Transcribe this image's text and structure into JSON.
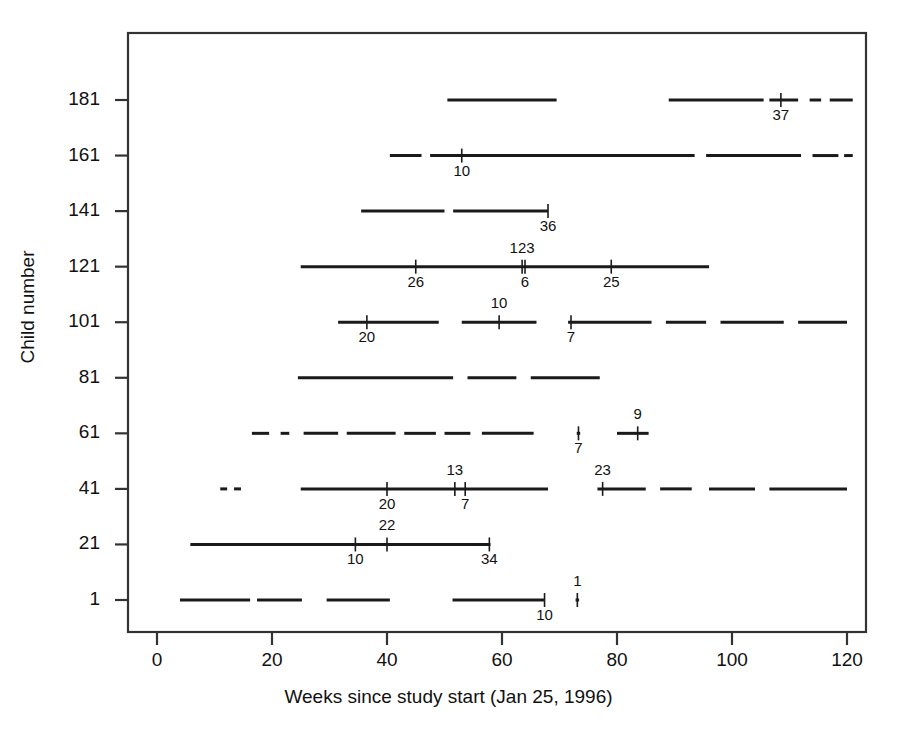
{
  "chart_data": {
    "type": "line",
    "title": "",
    "xlabel": "Weeks since study start (Jan 25, 1996)",
    "ylabel": "Child number",
    "xlim": [
      -3,
      123
    ],
    "ylim": [
      -9,
      201
    ],
    "xticks": [
      0,
      20,
      40,
      60,
      80,
      100,
      120
    ],
    "yticks": [
      1,
      21,
      41,
      61,
      81,
      101,
      121,
      141,
      161,
      181
    ],
    "grid": false,
    "legend": null,
    "series": [
      {
        "name": "1",
        "y": 1,
        "segments": [
          [
            4.0,
            16.2
          ],
          [
            17.4,
            25.2
          ],
          [
            29.5,
            40.5
          ],
          [
            51.4,
            67.4
          ],
          [
            72.8,
            73.4
          ]
        ],
        "markers": [
          {
            "x": 67.4,
            "label": "10",
            "pos": "below"
          },
          {
            "x": 73.1,
            "label": "1",
            "pos": "above"
          }
        ]
      },
      {
        "name": "21",
        "y": 21,
        "segments": [
          [
            5.8,
            58.0
          ]
        ],
        "markers": [
          {
            "x": 34.5,
            "label": "10",
            "pos": "below"
          },
          {
            "x": 40.0,
            "label": "22",
            "pos": "above"
          },
          {
            "x": 57.8,
            "label": "34",
            "pos": "below"
          }
        ]
      },
      {
        "name": "41",
        "y": 41,
        "segments": [
          [
            11.0,
            12.2
          ],
          [
            13.4,
            14.6
          ],
          [
            25.0,
            68.0
          ],
          [
            76.6,
            85.0
          ],
          [
            87.5,
            93.0
          ],
          [
            96.0,
            104.0
          ],
          [
            106.5,
            120.0
          ]
        ],
        "markers": [
          {
            "x": 40.0,
            "label": "20",
            "pos": "below"
          },
          {
            "x": 51.8,
            "label": "13",
            "pos": "above"
          },
          {
            "x": 53.6,
            "label": "7",
            "pos": "below"
          },
          {
            "x": 77.5,
            "label": "23",
            "pos": "above"
          }
        ]
      },
      {
        "name": "61",
        "y": 61,
        "segments": [
          [
            16.5,
            19.5
          ],
          [
            21.5,
            23.0
          ],
          [
            25.5,
            31.5
          ],
          [
            33.0,
            41.5
          ],
          [
            43.0,
            48.5
          ],
          [
            50.0,
            54.5
          ],
          [
            56.5,
            65.5
          ],
          [
            73.0,
            73.6
          ],
          [
            80.0,
            85.5
          ]
        ],
        "markers": [
          {
            "x": 73.3,
            "label": "7",
            "pos": "below"
          },
          {
            "x": 83.6,
            "label": "9",
            "pos": "above"
          }
        ]
      },
      {
        "name": "81",
        "y": 81,
        "segments": [
          [
            24.5,
            51.5
          ],
          [
            54.0,
            62.5
          ],
          [
            65.0,
            77.0
          ]
        ],
        "markers": []
      },
      {
        "name": "101",
        "y": 101,
        "segments": [
          [
            31.5,
            49.0
          ],
          [
            53.0,
            66.0
          ],
          [
            71.5,
            86.0
          ],
          [
            88.5,
            95.5
          ],
          [
            98.0,
            109.0
          ],
          [
            111.5,
            120.0
          ]
        ],
        "markers": [
          {
            "x": 36.5,
            "label": "20",
            "pos": "below"
          },
          {
            "x": 59.5,
            "label": "10",
            "pos": "above"
          },
          {
            "x": 72.0,
            "label": "7",
            "pos": "below"
          }
        ]
      },
      {
        "name": "121",
        "y": 121,
        "segments": [
          [
            25.0,
            96.0
          ]
        ],
        "markers": [
          {
            "x": 45.0,
            "label": "26",
            "pos": "below"
          },
          {
            "x": 63.5,
            "label": "123",
            "pos": "above"
          },
          {
            "x": 64.0,
            "label": "6",
            "pos": "below"
          },
          {
            "x": 79.0,
            "label": "25",
            "pos": "below"
          }
        ]
      },
      {
        "name": "141",
        "y": 141,
        "segments": [
          [
            35.5,
            50.0
          ],
          [
            51.5,
            68.0
          ]
        ],
        "markers": [
          {
            "x": 68.0,
            "label": "36",
            "pos": "below"
          }
        ]
      },
      {
        "name": "161",
        "y": 161,
        "segments": [
          [
            40.5,
            46.0
          ],
          [
            47.5,
            93.5
          ],
          [
            95.5,
            112.0
          ],
          [
            114.0,
            118.5
          ],
          [
            119.5,
            121.0
          ]
        ],
        "markers": [
          {
            "x": 53.0,
            "label": "10",
            "pos": "below"
          }
        ]
      },
      {
        "name": "181",
        "y": 181,
        "segments": [
          [
            50.5,
            69.5
          ],
          [
            89.0,
            105.5
          ],
          [
            106.5,
            111.5
          ],
          [
            113.5,
            115.5
          ],
          [
            117.0,
            121.0
          ]
        ],
        "markers": [
          {
            "x": 108.5,
            "label": "37",
            "pos": "below"
          }
        ]
      }
    ]
  },
  "axes": {
    "x_label": "Weeks since study start (Jan 25, 1996)",
    "y_label": "Child number",
    "x_tick_labels": [
      "0",
      "20",
      "40",
      "60",
      "80",
      "100",
      "120"
    ],
    "y_tick_labels": [
      "1",
      "21",
      "41",
      "61",
      "81",
      "101",
      "121",
      "141",
      "161",
      "181"
    ]
  },
  "style": {
    "line_color": "#1a1a1a",
    "axis_color": "#333333",
    "background": "#ffffff"
  },
  "cut_off_header": "Figure legend (cropped)"
}
